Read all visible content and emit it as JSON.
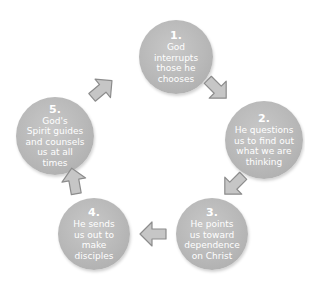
{
  "diagram": {
    "type": "cycle",
    "colors": {
      "node_fill": "#b9b9b9",
      "node_text": "#ffffff",
      "arrow_fill": "#c4c4c4",
      "arrow_stroke": "#8a8a8a"
    },
    "steps": [
      {
        "number": "1.",
        "text": "God\ninterrupts\nthose he\nchooses"
      },
      {
        "number": "2.",
        "text": "He questions\nus to find out\nwhat we are\nthinking"
      },
      {
        "number": "3.",
        "text": "He points\nus toward\ndependence\non Christ"
      },
      {
        "number": "4.",
        "text": "He sends\nus out to\nmake\ndisciples"
      },
      {
        "number": "5.",
        "text": "God's\nSpirit guides\nand counsels\nus at all\ntimes"
      }
    ],
    "arrows": [
      {
        "from": "1",
        "to": "2",
        "direction": "down-right"
      },
      {
        "from": "2",
        "to": "3",
        "direction": "down-left"
      },
      {
        "from": "3",
        "to": "4",
        "direction": "left"
      },
      {
        "from": "4",
        "to": "5",
        "direction": "up"
      },
      {
        "from": "5",
        "to": "1",
        "direction": "up-right"
      }
    ]
  }
}
